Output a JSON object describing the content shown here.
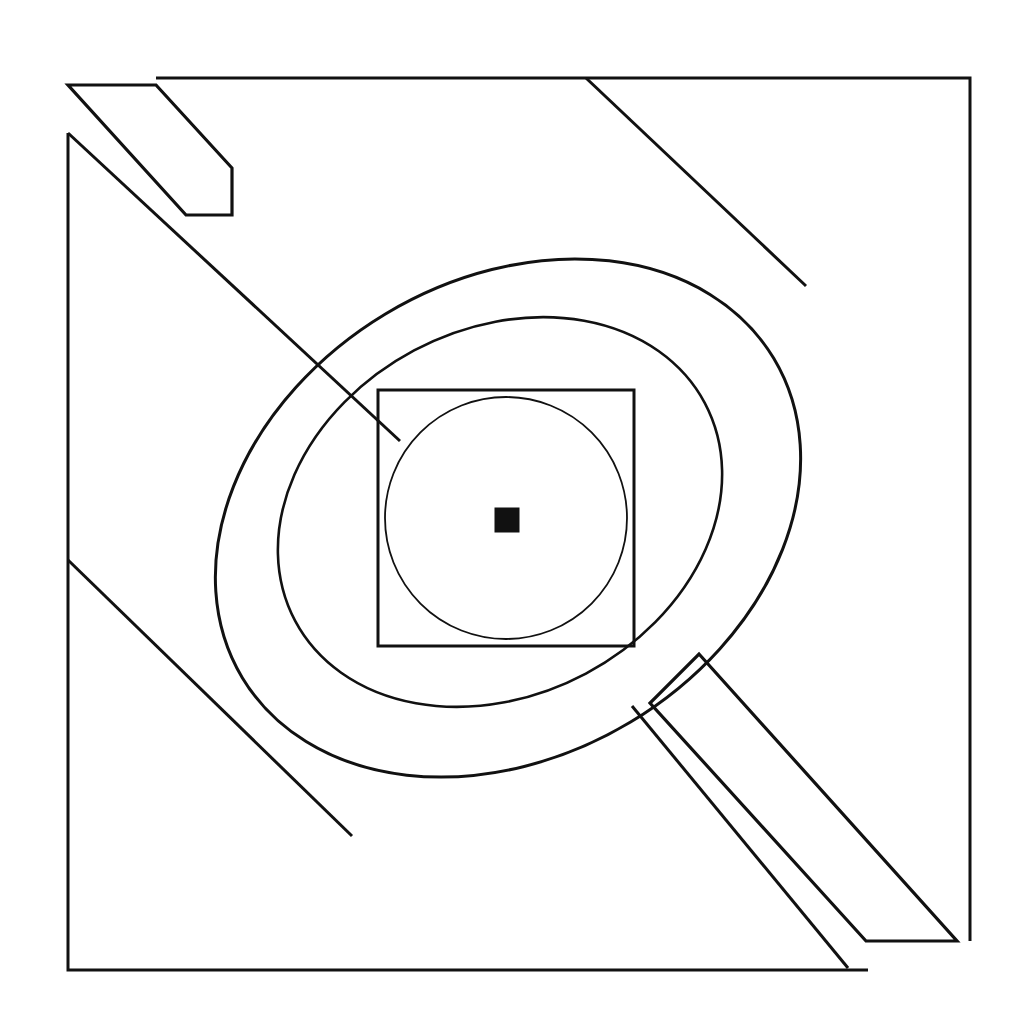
{
  "figure": {
    "background_color": "#ffffff",
    "ink_color": "#111111",
    "canvas": {
      "width": 1023,
      "height": 1019
    }
  },
  "geometry": {
    "outer_frame": {
      "name": "outer-square-frame",
      "left": 68,
      "top": 78,
      "right": 970,
      "bottom": 970,
      "stroke_width": 3,
      "corner_breaks": [
        "top-left",
        "bottom-right"
      ]
    },
    "outer_oval": {
      "name": "large-tilted-oval",
      "center_x": 508,
      "center_y": 518,
      "radius_x": 310,
      "radius_y": 238,
      "rotation_deg": -31,
      "stroke_width": 3
    },
    "inner_oval": {
      "name": "small-tilted-oval",
      "center_x": 500,
      "center_y": 512,
      "radius_x": 232,
      "radius_y": 183,
      "rotation_deg": -28,
      "stroke_width": 2.6
    },
    "inner_square": {
      "name": "inner-square",
      "left": 378,
      "top": 390,
      "size": 256,
      "stroke_width": 3
    },
    "inscribed_circle": {
      "name": "inscribed-circle",
      "center_x": 506,
      "center_y": 518,
      "radius": 121,
      "stroke_width": 1.8
    },
    "center_dot": {
      "name": "center-black-square",
      "center_x": 507,
      "center_y": 520,
      "size": 25,
      "fill": "#111111"
    },
    "ribbons": [
      {
        "name": "ribbon-top-left",
        "band_points": "68,85 156,85 232,166 232,213 184,213",
        "stroke_width": 3.2
      },
      {
        "name": "ribbon-bottom-right",
        "band_points": "700,655 955,941 868,941 651,704",
        "stroke_width": 3.2
      }
    ],
    "tangent_lines": [
      {
        "name": "tangent-line-upper-left",
        "x1": 68,
        "y1": 133,
        "x2": 400,
        "y2": 441,
        "stroke_width": 3
      },
      {
        "name": "tangent-line-upper-right",
        "x1": 586,
        "y1": 78,
        "x2": 806,
        "y2": 286,
        "stroke_width": 3
      },
      {
        "name": "tangent-line-lower-left",
        "x1": 68,
        "y1": 560,
        "x2": 352,
        "y2": 836,
        "stroke_width": 3
      },
      {
        "name": "tangent-line-lower-right",
        "x1": 632,
        "y1": 706,
        "x2": 848,
        "y2": 968,
        "stroke_width": 3
      }
    ]
  },
  "labels": {
    "none_visible": "This image contains no text, axis ticks, legend, or UI chrome."
  }
}
